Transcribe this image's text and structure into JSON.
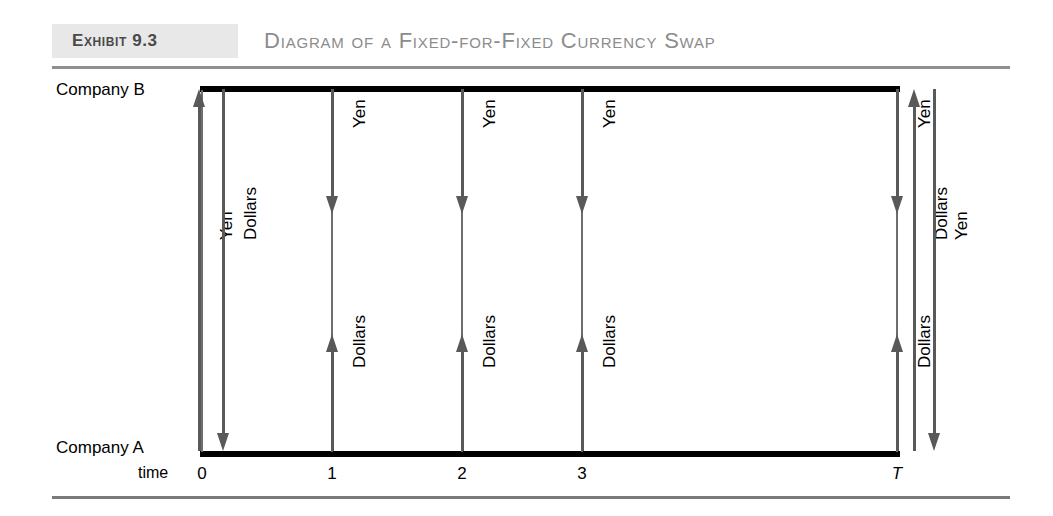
{
  "exhibit": {
    "tag": "Exhibit 9.3",
    "title": "Diagram of a Fixed-for-Fixed Currency Swap"
  },
  "axes": {
    "top_party": "Company B",
    "bottom_party": "Company A",
    "time_word": "time",
    "ticks": [
      "0",
      "1",
      "2",
      "3",
      "T"
    ]
  },
  "flows": [
    {
      "time": "0",
      "label": "Yen",
      "direction": "up"
    },
    {
      "time": "0",
      "label": "Dollars",
      "direction": "down"
    },
    {
      "time": "1",
      "label": "Yen",
      "direction": "down"
    },
    {
      "time": "1",
      "label": "Dollars",
      "direction": "up"
    },
    {
      "time": "2",
      "label": "Yen",
      "direction": "down"
    },
    {
      "time": "2",
      "label": "Dollars",
      "direction": "up"
    },
    {
      "time": "3",
      "label": "Yen",
      "direction": "down"
    },
    {
      "time": "3",
      "label": "Dollars",
      "direction": "up"
    },
    {
      "time": "T",
      "label": "Yen",
      "direction": "down"
    },
    {
      "time": "T",
      "label": "Dollars",
      "direction": "up"
    },
    {
      "time": "T",
      "label": "Dollars",
      "direction": "up"
    },
    {
      "time": "T",
      "label": "Yen",
      "direction": "down"
    }
  ],
  "labels": {
    "yen": "Yen",
    "dollars": "Dollars"
  },
  "colors": {
    "line": "#000000",
    "arrow": "#595959",
    "grid": "#6e6e6e",
    "title": "#8c8c8c",
    "tag_bg": "#e8e8e8",
    "tag_text": "#4a4a4a"
  }
}
